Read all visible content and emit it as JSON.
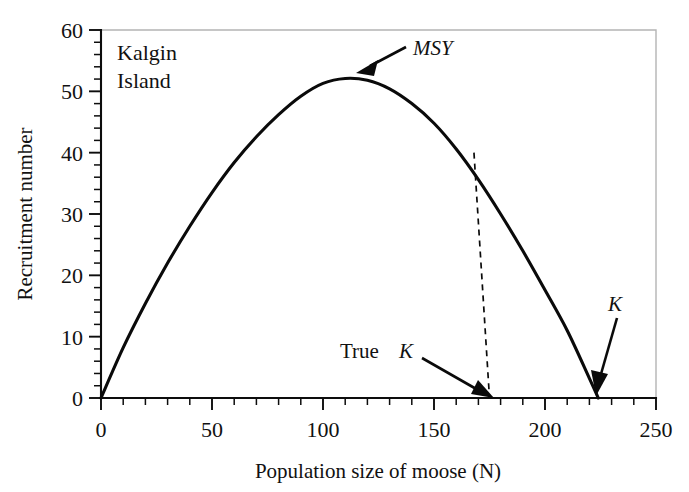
{
  "chart_data": {
    "type": "line",
    "title": "",
    "subtitle": "",
    "panel_label": [
      "Kalgin",
      "Island"
    ],
    "panel_label_text": "Kalgin Island",
    "xlabel": "Population size of moose (N)",
    "ylabel": "Recruitment number",
    "xlim": [
      0,
      250
    ],
    "ylim": [
      0,
      60
    ],
    "x_major_ticks": [
      0,
      50,
      100,
      150,
      200,
      250
    ],
    "x_tick_labels": [
      "0",
      "50",
      "100",
      "150",
      "200",
      "250"
    ],
    "x_minor_tick_step": 10,
    "y_major_ticks": [
      0,
      10,
      20,
      30,
      40,
      50,
      60
    ],
    "y_tick_labels": [
      "0",
      "10",
      "20",
      "30",
      "40",
      "50",
      "60"
    ],
    "y_minor_tick_step": 2,
    "grid": false,
    "legend": "none",
    "series": [
      {
        "name": "Recruitment curve",
        "style": "solid",
        "x": [
          0,
          10,
          20,
          30,
          40,
          50,
          60,
          70,
          80,
          90,
          100,
          110,
          120,
          130,
          140,
          150,
          160,
          170,
          180,
          190,
          200,
          210,
          220,
          224
        ],
        "y": [
          0,
          8.2,
          15.4,
          22.0,
          28.0,
          33.5,
          38.4,
          42.6,
          46.2,
          49.2,
          51.3,
          52.1,
          51.8,
          50.4,
          48.0,
          44.8,
          40.6,
          35.6,
          30.0,
          24.0,
          17.6,
          11.0,
          3.2,
          0.0
        ]
      },
      {
        "name": "True K cutoff",
        "style": "dashed",
        "x": [
          168,
          175
        ],
        "y": [
          40,
          0
        ]
      }
    ],
    "annotations": [
      {
        "id": "msy",
        "label": "MSY",
        "style": "italic",
        "text_x": 147,
        "text_y": 55.5,
        "point_x": 112,
        "point_y": 52.3
      },
      {
        "id": "true-k",
        "label": "True K",
        "style": "mixed-italic-k",
        "label_plain": "True",
        "label_italic": "K",
        "text_x": 116,
        "text_y": 7.0,
        "point_x": 175,
        "point_y": 0.4
      },
      {
        "id": "carrying-capacity-k",
        "label": "K",
        "style": "italic",
        "text_x": 233,
        "text_y": 15.0,
        "point_x": 224,
        "point_y": 0.5
      }
    ]
  },
  "colors": {
    "curve": "#0a0a0a",
    "axis": "#0d0d0d",
    "frame": "#b4b4b4",
    "background": "#ffffff",
    "text": "#111111"
  }
}
